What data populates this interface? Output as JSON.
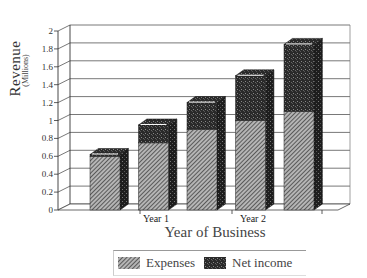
{
  "chart_data": {
    "type": "bar",
    "stacked": true,
    "style": "3d",
    "title": "",
    "xlabel": "Year of Business",
    "ylabel": "Revenue",
    "ylabel_sub": "(Millions)",
    "ylim": [
      0,
      2
    ],
    "yticks": [
      "0",
      "0.2",
      "0.4",
      "0.6",
      "0.8",
      "1",
      "1.2",
      "1.4",
      "1.6",
      "1.8",
      "2"
    ],
    "categories": [
      "",
      "Year 1",
      "",
      "Year 2",
      ""
    ],
    "series": [
      {
        "name": "Expenses",
        "values": [
          0.6,
          0.75,
          0.9,
          1.0,
          1.1
        ],
        "pattern": "diagonal-hatch",
        "color": "#8a8a8a"
      },
      {
        "name": "Net income",
        "values": [
          0.02,
          0.2,
          0.3,
          0.5,
          0.75
        ],
        "pattern": "speckled-dark",
        "color": "#2e2e2e"
      }
    ],
    "grid": true,
    "legend_position": "bottom"
  },
  "axis": {
    "ylabel": "Revenue",
    "ylabel_sub": "(Millions)",
    "xtitle": "Year of Business",
    "xticks": [
      {
        "label": "Year 1",
        "left": 143
      },
      {
        "label": "Year 2",
        "left": 240
      }
    ]
  },
  "legend": {
    "items": [
      {
        "label": "Expenses"
      },
      {
        "label": "Net income"
      }
    ]
  }
}
